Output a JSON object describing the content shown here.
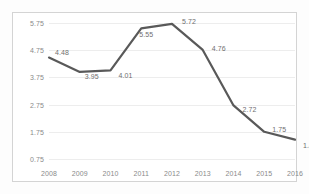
{
  "chart_data": {
    "type": "line",
    "title": "",
    "subtitle": "",
    "xlabel": "",
    "ylabel": "",
    "categories": [
      "2008",
      "2009",
      "2010",
      "2011",
      "2012",
      "2013",
      "2014",
      "2015",
      "2016"
    ],
    "values": [
      4.48,
      3.95,
      4.01,
      5.55,
      5.72,
      4.76,
      2.72,
      1.75,
      1.46
    ],
    "point_labels": [
      "4.48",
      "3.95",
      "4.01",
      "5.55",
      "5.72",
      "4.76",
      "2.72",
      "1.75",
      "1.46"
    ],
    "yticks": [
      0.75,
      1.75,
      2.75,
      3.75,
      4.75,
      5.75
    ],
    "ytick_labels": [
      "0.75",
      "1.75",
      "2.75",
      "3.75",
      "4.75",
      "5.75"
    ],
    "xtick_labels": [
      "2008",
      "2009",
      "2010",
      "2011",
      "2012",
      "2013",
      "2014",
      "2015",
      "2016"
    ],
    "ylim": [
      0.75,
      5.75
    ],
    "grid": true,
    "legend": false,
    "legend_position": "none",
    "series": [
      {
        "name": "",
        "values": [
          4.48,
          3.95,
          4.01,
          5.55,
          5.72,
          4.76,
          2.72,
          1.75,
          1.46
        ]
      }
    ],
    "colors": {
      "line": "#595959",
      "gridline": "#ededed",
      "border": "#d4d4d4",
      "tick_text": "#8a8a8a",
      "label_text": "#6f6f6f",
      "background": "#ffffff"
    },
    "label_offsets": [
      {
        "dx": 13,
        "dy": -6
      },
      {
        "dx": 12,
        "dy": 4
      },
      {
        "dx": 15,
        "dy": 5
      },
      {
        "dx": 5,
        "dy": 6
      },
      {
        "dx": 17,
        "dy": -3
      },
      {
        "dx": 16,
        "dy": -2
      },
      {
        "dx": 16,
        "dy": 4
      },
      {
        "dx": 15,
        "dy": -3
      },
      {
        "dx": 15,
        "dy": 5
      }
    ]
  }
}
